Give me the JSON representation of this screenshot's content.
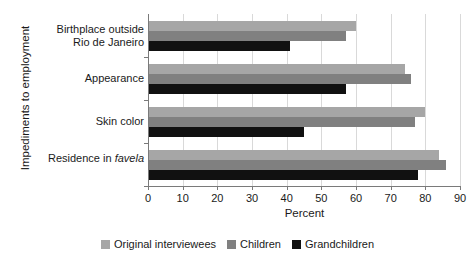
{
  "chart_data": {
    "type": "bar",
    "orientation": "horizontal",
    "title": "",
    "xlabel": "Percent",
    "ylabel": "Impediments to employment",
    "categories": [
      "Birthplace outside Rio de Janeiro",
      "Appearance",
      "Skin color",
      "Residence in favela"
    ],
    "category_lines": [
      [
        "Birthplace outside",
        "Rio de Janeiro"
      ],
      [
        "Appearance"
      ],
      [
        "Skin color"
      ],
      [
        "Residence in ",
        "favela"
      ]
    ],
    "series": [
      {
        "name": "Original interviewees",
        "color": "#a6a6a6",
        "values": [
          60,
          74,
          80,
          84
        ]
      },
      {
        "name": "Children",
        "color": "#808080",
        "values": [
          57,
          76,
          77,
          86
        ]
      },
      {
        "name": "Grandchildren",
        "color": "#111111",
        "values": [
          41,
          57,
          45,
          78
        ]
      }
    ],
    "xlim": [
      0,
      90
    ],
    "xticks": [
      0,
      10,
      20,
      30,
      40,
      50,
      60,
      70,
      80,
      90
    ],
    "xticklabels": [
      "0",
      "10",
      "20",
      "30",
      "40",
      "50",
      "60",
      "70",
      "80",
      "90"
    ],
    "grid": "vertical",
    "legend_position": "bottom"
  },
  "legend": {
    "entries": [
      {
        "label": "Original interviewees",
        "color": "#a6a6a6"
      },
      {
        "label": "Children",
        "color": "#808080"
      },
      {
        "label": "Grandchildren",
        "color": "#111111"
      }
    ]
  }
}
